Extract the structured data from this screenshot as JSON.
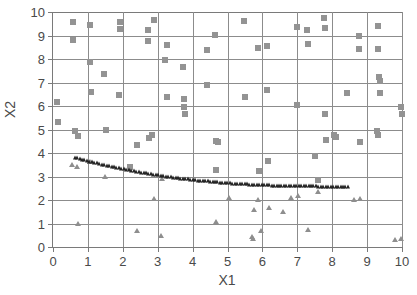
{
  "chart": {
    "type": "scatter",
    "title": "",
    "xlabel": "X1",
    "ylabel": "X2",
    "xlim": [
      0,
      10
    ],
    "ylim": [
      0,
      10
    ],
    "xticks": [
      "0",
      "1",
      "2",
      "3",
      "4",
      "5",
      "6",
      "7",
      "8",
      "9",
      "10"
    ],
    "yticks": [
      "0",
      "1",
      "2",
      "3",
      "4",
      "5",
      "6",
      "7",
      "8",
      "9",
      "10"
    ],
    "grid": true,
    "legend": "none",
    "colors": {
      "square_marker": "#939393",
      "triangle_marker": "#8e8e8e",
      "curve_marker": "#232323",
      "gridline": "#8c8c8c",
      "axis": "#7a7a7a",
      "text": "#4a4a4a",
      "background": "#ffffff"
    }
  },
  "chart_data": {
    "type": "scatter",
    "title": "",
    "xlabel": "X1",
    "ylabel": "X2",
    "xlim": [
      0,
      10
    ],
    "ylim": [
      0,
      10
    ],
    "grid": true,
    "legend_position": "none",
    "series": [
      {
        "name": "scattered-squares",
        "marker": "square",
        "color": "#939393",
        "points": [
          [
            0.12,
            6.17
          ],
          [
            0.14,
            5.32
          ],
          [
            0.56,
            9.57
          ],
          [
            0.57,
            8.79
          ],
          [
            0.62,
            4.95
          ],
          [
            0.72,
            4.73
          ],
          [
            1.05,
            9.46
          ],
          [
            1.06,
            7.88
          ],
          [
            1.08,
            6.58
          ],
          [
            1.45,
            7.36
          ],
          [
            1.52,
            5.0
          ],
          [
            1.92,
            9.56
          ],
          [
            1.93,
            9.26
          ],
          [
            1.9,
            6.47
          ],
          [
            2.22,
            3.39
          ],
          [
            2.42,
            4.36
          ],
          [
            2.72,
            9.24
          ],
          [
            2.72,
            8.76
          ],
          [
            2.76,
            4.62
          ],
          [
            2.85,
            4.78
          ],
          [
            2.88,
            9.66
          ],
          [
            3.22,
            7.96
          ],
          [
            3.28,
            8.58
          ],
          [
            3.26,
            6.37
          ],
          [
            3.72,
            7.68
          ],
          [
            3.74,
            6.28
          ],
          [
            3.76,
            5.96
          ],
          [
            3.78,
            5.66
          ],
          [
            4.4,
            8.38
          ],
          [
            4.42,
            6.89
          ],
          [
            4.65,
            9.04
          ],
          [
            4.68,
            4.5
          ],
          [
            4.72,
            4.47
          ],
          [
            4.66,
            3.26
          ],
          [
            5.48,
            9.62
          ],
          [
            5.5,
            6.37
          ],
          [
            5.88,
            8.46
          ],
          [
            5.9,
            3.25
          ],
          [
            6.12,
            8.56
          ],
          [
            6.14,
            6.68
          ],
          [
            6.16,
            3.68
          ],
          [
            6.98,
            9.36
          ],
          [
            7.0,
            6.05
          ],
          [
            7.28,
            9.24
          ],
          [
            7.3,
            8.64
          ],
          [
            7.52,
            3.88
          ],
          [
            7.58,
            2.86
          ],
          [
            7.76,
            9.74
          ],
          [
            7.78,
            9.34
          ],
          [
            7.8,
            5.64
          ],
          [
            7.82,
            4.56
          ],
          [
            8.1,
            4.7
          ],
          [
            8.06,
            4.78
          ],
          [
            8.42,
            6.56
          ],
          [
            8.76,
            8.96
          ],
          [
            8.78,
            8.44
          ],
          [
            8.8,
            4.46
          ],
          [
            9.32,
            9.42
          ],
          [
            9.3,
            8.44
          ],
          [
            9.34,
            7.22
          ],
          [
            9.36,
            7.08
          ],
          [
            9.38,
            6.56
          ],
          [
            9.28,
            4.94
          ],
          [
            9.32,
            4.78
          ],
          [
            9.98,
            5.96
          ],
          [
            9.99,
            5.64
          ]
        ]
      },
      {
        "name": "scattered-triangles",
        "marker": "triangle",
        "color": "#8e8e8e",
        "points": [
          [
            0.55,
            3.5
          ],
          [
            0.68,
            3.4
          ],
          [
            0.72,
            0.98
          ],
          [
            1.05,
            3.62
          ],
          [
            1.5,
            2.99
          ],
          [
            2.4,
            0.7
          ],
          [
            2.9,
            2.06
          ],
          [
            3.1,
            0.47
          ],
          [
            3.12,
            2.9
          ],
          [
            5.05,
            2.1
          ],
          [
            4.68,
            1.08
          ],
          [
            5.7,
            0.44
          ],
          [
            5.72,
            0.32
          ],
          [
            5.75,
            1.56
          ],
          [
            5.88,
            1.99
          ],
          [
            5.95,
            0.7
          ],
          [
            6.18,
            1.68
          ],
          [
            6.6,
            1.48
          ],
          [
            6.82,
            2.08
          ],
          [
            7.02,
            2.16
          ],
          [
            7.3,
            0.72
          ],
          [
            7.58,
            2.34
          ],
          [
            8.62,
            1.99
          ],
          [
            8.8,
            2.04
          ],
          [
            9.8,
            0.28
          ],
          [
            9.98,
            0.32
          ]
        ]
      },
      {
        "name": "fitted-curve",
        "marker": "triangle-dense",
        "color": "#232323",
        "description": "Dense decaying curve from (0.62, 3.80) flattening to (8.45, 2.57)",
        "x_start": 0.62,
        "x_end": 8.45,
        "y_start": 3.8,
        "y_end": 2.57,
        "n_points": 112
      }
    ]
  }
}
